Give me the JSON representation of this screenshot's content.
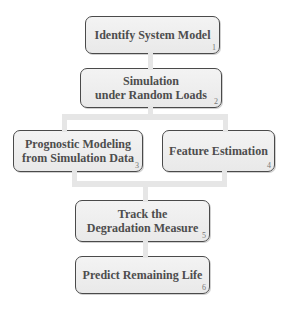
{
  "diagram": {
    "type": "flowchart",
    "colors": {
      "box_fill": "#eeeeee",
      "box_border": "#4a4a4a",
      "text": "#4d4d4d",
      "connector": "#e6e6e6"
    },
    "nodes": [
      {
        "id": 1,
        "label": "Identify System Model",
        "number": "1"
      },
      {
        "id": 2,
        "label": "Simulation\nunder Random Loads",
        "number": "2"
      },
      {
        "id": 3,
        "label": "Prognostic Modeling\nfrom Simulation Data",
        "number": "3"
      },
      {
        "id": 4,
        "label": "Feature Estimation",
        "number": "4"
      },
      {
        "id": 5,
        "label": "Track the\nDegradation Measure",
        "number": "5"
      },
      {
        "id": 6,
        "label": "Predict Remaining Life",
        "number": "6"
      }
    ],
    "edges": [
      {
        "from": 1,
        "to": 2
      },
      {
        "from": 2,
        "to": 3
      },
      {
        "from": 2,
        "to": 4
      },
      {
        "from": 3,
        "to": 5
      },
      {
        "from": 4,
        "to": 5
      },
      {
        "from": 5,
        "to": 6
      }
    ]
  }
}
